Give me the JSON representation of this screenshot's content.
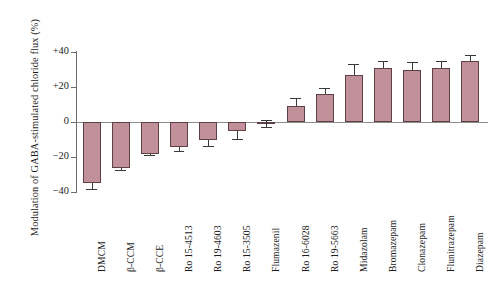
{
  "chart_data": {
    "type": "bar",
    "title": "",
    "xlabel": "",
    "ylabel": "Modulation of GABA-stimulated chloride flux (%)",
    "ylim": [
      -40,
      40
    ],
    "yticks": [
      40,
      20,
      0,
      -20,
      -40
    ],
    "ytick_labels": [
      "+40",
      "+20",
      "0",
      "−20",
      "−40"
    ],
    "grid": false,
    "legend": null,
    "categories": [
      "DMCM",
      "β-CCM",
      "β-CCE",
      "Ro 15-4513",
      "Ro 19-4603",
      "Ro 15-3505",
      "Flumazenil",
      "Ro 16-6028",
      "Ro 19-5663",
      "Midazolam",
      "Bromazepam",
      "Clonazepam",
      "Flunitrazepam",
      "Diazepam"
    ],
    "values": [
      -35,
      -26,
      -18,
      -14,
      -10,
      -5,
      -1,
      9,
      16,
      27,
      31,
      30,
      31,
      35
    ],
    "errors": [
      3,
      1.5,
      1,
      2.5,
      3.5,
      4.5,
      2,
      5,
      3.5,
      6,
      4,
      4.5,
      4,
      3.5
    ],
    "bar_color": "#c2909a",
    "bar_edge_color": "#5d4145",
    "axis_color": "#6d6d6d",
    "error_bar_color": "#3a3a3a"
  }
}
